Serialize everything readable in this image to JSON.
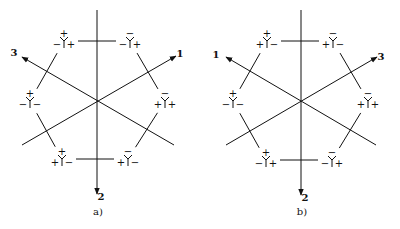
{
  "panels": [
    {
      "id": "a",
      "caption": "a)",
      "center": [
        97,
        100
      ],
      "axes": [
        {
          "label": "1",
          "from": [
            22,
            145
          ],
          "to": [
            176,
            56
          ],
          "label_pos": [
            180,
            54
          ]
        },
        {
          "label": "2",
          "from": [
            97,
            10
          ],
          "to": [
            97,
            194
          ],
          "label_pos": [
            101,
            197
          ]
        },
        {
          "label": "3",
          "from": [
            174,
            145
          ],
          "to": [
            22,
            57
          ],
          "label_pos": [
            14,
            53
          ]
        }
      ],
      "nodes": [
        {
          "pos": [
            64,
            41
          ],
          "top": "+",
          "left": "−",
          "right": "+"
        },
        {
          "pos": [
            130,
            41
          ],
          "top": "−",
          "left": "−",
          "right": "+"
        },
        {
          "pos": [
            30,
            101
          ],
          "top": "+",
          "left": "−",
          "right": "−"
        },
        {
          "pos": [
            165,
            101
          ],
          "top": "−",
          "left": "+",
          "right": "+"
        },
        {
          "pos": [
            62,
            159
          ],
          "top": "+",
          "left": "+",
          "right": "−"
        },
        {
          "pos": [
            128,
            159
          ],
          "top": "−",
          "left": "+",
          "right": "−"
        }
      ]
    },
    {
      "id": "b",
      "caption": "b)",
      "center": [
        301,
        101
      ],
      "axes": [
        {
          "label": "1",
          "from": [
            376,
            145
          ],
          "to": [
            226,
            57
          ],
          "label_pos": [
            216,
            55
          ]
        },
        {
          "label": "2",
          "from": [
            301,
            10
          ],
          "to": [
            301,
            195
          ],
          "label_pos": [
            305,
            198
          ]
        },
        {
          "label": "3",
          "from": [
            226,
            145
          ],
          "to": [
            377,
            57
          ],
          "label_pos": [
            381,
            57
          ]
        }
      ],
      "nodes": [
        {
          "pos": [
            267,
            41
          ],
          "top": "+",
          "left": "+",
          "right": "−"
        },
        {
          "pos": [
            333,
            41
          ],
          "top": "−",
          "left": "+",
          "right": "−"
        },
        {
          "pos": [
            233,
            101
          ],
          "top": "+",
          "left": "−",
          "right": "−"
        },
        {
          "pos": [
            368,
            101
          ],
          "top": "−",
          "left": "+",
          "right": "+"
        },
        {
          "pos": [
            266,
            160
          ],
          "top": "+",
          "left": "−",
          "right": "+"
        },
        {
          "pos": [
            332,
            160
          ],
          "top": "−",
          "left": "−",
          "right": "+"
        }
      ]
    }
  ]
}
